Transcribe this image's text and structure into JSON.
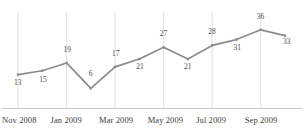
{
  "chart_data": {
    "type": "line",
    "title": "",
    "subtitle": "",
    "xlabel": "",
    "ylabel": "",
    "grid": "vertical-every-other-category",
    "legend": "none",
    "line_color": "#8c8c8c",
    "marker_color": "#8c8c8c",
    "axis_color": "#c8c8c8",
    "gridline_color": "#d9d9d9",
    "label_color": "#4a4a4a",
    "categories": [
      "Nov 2008",
      "Dec 2008",
      "Jan 2009",
      "Feb 2009",
      "Mar 2009",
      "Apr 2009",
      "May 2009",
      "Jun 2009",
      "Jul 2009",
      "Aug 2009",
      "Sep 2009",
      "Oct 2009"
    ],
    "values": [
      13,
      15,
      19,
      6,
      17,
      21,
      27,
      21,
      28,
      31,
      36,
      33
    ],
    "point_labels": [
      "13",
      "15",
      "19",
      "6",
      "17",
      "21",
      "27",
      "21",
      "28",
      "31",
      "36",
      "33"
    ],
    "ylim": [
      0,
      40
    ],
    "tick_labels": [
      "Nov 2008",
      "Jan 2009",
      "Mar 2009",
      "May 2009",
      "Jul 2009",
      "Sep 2009"
    ],
    "tick_indices": [
      0,
      2,
      4,
      6,
      8,
      10
    ]
  }
}
